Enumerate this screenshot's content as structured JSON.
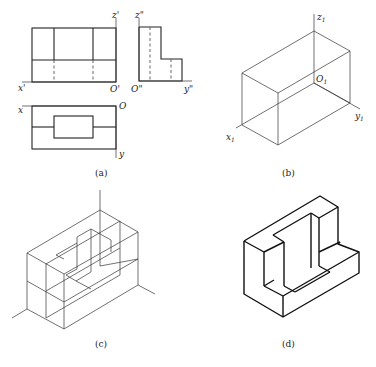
{
  "figure": {
    "panels": [
      {
        "id": "a",
        "caption": "(a)",
        "description": "Three-view orthographic projection"
      },
      {
        "id": "b",
        "caption": "(b)",
        "description": "Bounding box with isometric axes"
      },
      {
        "id": "c",
        "caption": "(c)",
        "description": "Construction lines of isometric drawing"
      },
      {
        "id": "d",
        "caption": "(d)",
        "description": "Finished isometric drawing"
      }
    ],
    "labels_a": {
      "front_z": "z'",
      "front_x": "x'",
      "front_o": "O'",
      "side_z": "z\"",
      "side_o": "O\"",
      "side_y": "y\"",
      "top_x": "x",
      "top_o": "O",
      "top_y": "y"
    },
    "labels_b": {
      "z": "z",
      "z_sub": "1",
      "o": "O",
      "o_sub": "1",
      "y": "y",
      "y_sub": "1",
      "x": "x",
      "x_sub": "1"
    }
  }
}
